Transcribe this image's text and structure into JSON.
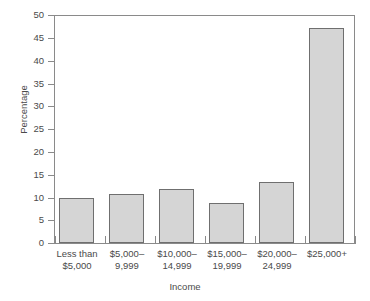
{
  "figure": {
    "background_color": "#ffffff",
    "top_cropped_caption_fragment": "",
    "axis_color": "#8a8a8a",
    "text_color": "#4a4a4a"
  },
  "chart_data": {
    "type": "bar",
    "title": "",
    "xlabel": "Income",
    "ylabel": "Percentage",
    "categories": [
      "Less than\n$5,000",
      "$5,000–\n9,999",
      "$10,000–\n14,999",
      "$15,000–\n19,999",
      "$20,000–\n24,999",
      "$25,000+"
    ],
    "values": [
      9.9,
      10.7,
      11.8,
      8.8,
      13.4,
      47.1
    ],
    "ylim": [
      0,
      50
    ],
    "yticks": [
      0,
      5,
      10,
      15,
      20,
      25,
      30,
      35,
      40,
      45,
      50
    ],
    "ytick_labels": [
      "0",
      "5",
      "10",
      "15",
      "20",
      "25",
      "30",
      "35",
      "40",
      "45",
      "50"
    ],
    "grid": false,
    "legend": false,
    "bar_fill_color": "#d5d5d5",
    "bar_edge_color": "#6f6f6f"
  }
}
